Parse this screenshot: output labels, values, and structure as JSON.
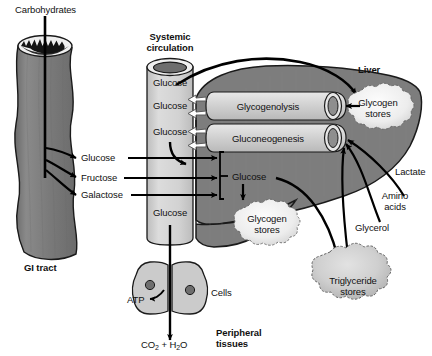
{
  "diagram": {
    "colors": {
      "organ_fill": "#7d7d7d",
      "organ_stroke": "#1a1a1a",
      "vessel_fill": "#d4d4d4",
      "vessel_top": "#6e6e6e",
      "tube_fill": "#cfcfcf",
      "store_fill": "#f2f2f2",
      "cell_fill": "#cccccc",
      "arrow_black": "#000000",
      "arrow_hollow_fill": "#ffffff",
      "text": "#111111"
    }
  },
  "labels": {
    "carbohydrates": "Carbohydrates",
    "gi_tract": "GI tract",
    "systemic_circulation_line1": "Systemic",
    "systemic_circulation_line2": "circulation",
    "liver": "Liver",
    "glucose_vessel_1": "Glucose",
    "glucose_vessel_2": "Glucose",
    "glucose_vessel_3": "Glucose",
    "glucose_vessel_4": "Glucose",
    "glucose_absorbed": "Glucose",
    "fructose_absorbed": "Fructose",
    "galactose_absorbed": "Galactose",
    "glycogenolysis": "Glycogenolysis",
    "gluconeogenesis": "Gluconeogenesis",
    "glycogen_stores_liver_line1": "Glycogen",
    "glycogen_stores_liver_line2": "stores",
    "glucose_liver": "Glucose",
    "glycogen_stores_hepatic_line1": "Glycogen",
    "glycogen_stores_hepatic_line2": "stores",
    "lactate": "Lactate",
    "amino_acids_line1": "Amino",
    "amino_acids_line2": "acids",
    "glycerol": "Glycerol",
    "triglyceride_stores_line1": "Triglyceride",
    "triglyceride_stores_line2": "stores",
    "atp": "ATP",
    "cells": "Cells",
    "co2_h2o_prefix": "CO",
    "co2_sub": "2",
    "co2_h2o_mid": " + H",
    "h2o_sub": "2",
    "h2o_suffix": "O",
    "peripheral_tissues_line1": "Peripheral",
    "peripheral_tissues_line2": "tissues"
  }
}
